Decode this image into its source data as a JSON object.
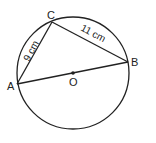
{
  "diagram": {
    "circle": {
      "cx": 73,
      "cy": 73,
      "r": 56,
      "stroke": "#222222"
    },
    "points": {
      "A": {
        "x": 17,
        "y": 84,
        "label": "A",
        "lx": 7,
        "ly": 90
      },
      "B": {
        "x": 128,
        "y": 62,
        "label": "B",
        "lx": 131,
        "ly": 66
      },
      "C": {
        "x": 52,
        "y": 22,
        "label": "C",
        "lx": 47,
        "ly": 19
      },
      "O": {
        "x": 73,
        "y": 73,
        "label": "O",
        "lx": 69,
        "ly": 86
      }
    },
    "sides": {
      "AC": {
        "label": "9 cm"
      },
      "CB": {
        "label": "11 cm"
      }
    }
  }
}
